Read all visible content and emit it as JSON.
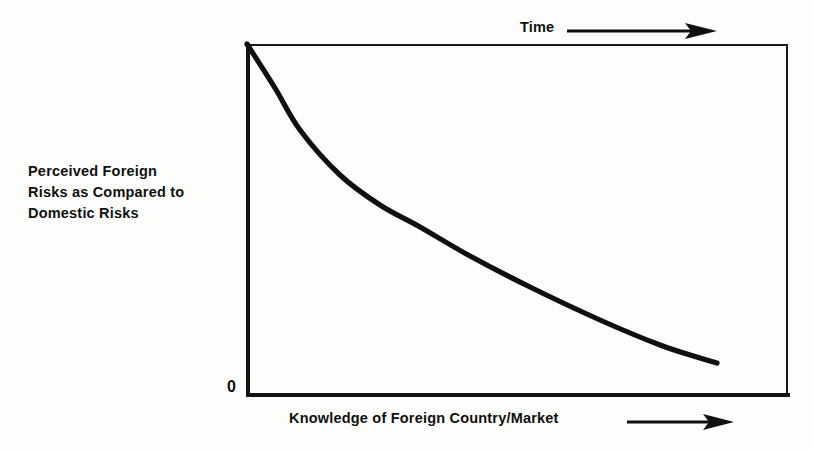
{
  "figure": {
    "background_color": "#fdfdfc",
    "ink_color": "#101010"
  },
  "axes": {
    "origin_label": "0",
    "x_axis_label": "Knowledge of Foreign Country/Market",
    "y_axis_label_lines": [
      "Perceived Foreign",
      "Risks as Compared to",
      "Domestic Risks"
    ],
    "y_axis_label": "Perceived Foreign Risks as Compared to Domestic Risks",
    "top_axis_label": "Time",
    "x_arrow_icon": "right-arrow-icon",
    "time_arrow_icon": "right-arrow-icon"
  },
  "chart_data": {
    "type": "line",
    "title": "",
    "subtitle": "",
    "xlabel": "Knowledge of Foreign Country/Market",
    "ylabel": "Perceived Foreign Risks as Compared to Domestic Risks",
    "secondary_xlabel": "Time",
    "grid": false,
    "legend": null,
    "legend_position": "none",
    "xlim": [
      0,
      100
    ],
    "ylim": [
      0,
      100
    ],
    "xticks": [],
    "yticks": [
      0
    ],
    "ytick_labels": [
      "0"
    ],
    "annotations": [
      "Time increases along the horizontal direction (top arrow)",
      "Knowledge of foreign country/market increases along the horizontal axis (bottom arrow)"
    ],
    "series": [
      {
        "name": "Perceived foreign risk",
        "style": "solid",
        "color": "#101010",
        "line_width": 4,
        "shape": "exponential-decay",
        "x": [
          0,
          5,
          10,
          17,
          24,
          32,
          40,
          50,
          60,
          70,
          80,
          87
        ],
        "y": [
          100,
          84,
          71,
          58,
          48,
          39,
          31,
          24,
          18,
          13,
          10,
          9
        ],
        "points_px": [
          [
            247,
            44
          ],
          [
            275,
            88
          ],
          [
            300,
            130
          ],
          [
            340,
            175
          ],
          [
            380,
            205
          ],
          [
            420,
            227
          ],
          [
            470,
            256
          ],
          [
            530,
            287
          ],
          [
            600,
            320
          ],
          [
            660,
            345
          ],
          [
            700,
            358
          ],
          [
            717,
            363
          ]
        ]
      }
    ]
  }
}
